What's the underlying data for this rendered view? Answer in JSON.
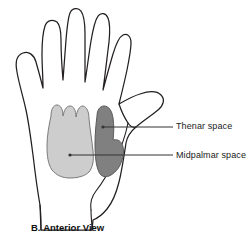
{
  "figure": {
    "caption_letter": "B.",
    "caption_title": "Anterior View",
    "view": "Anterior View"
  },
  "colors": {
    "outline": "#231f20",
    "midpalmar_fill": "#cdcdcd",
    "midpalmar_stroke": "#7a7a7a",
    "thenar_fill": "#808080",
    "thenar_stroke": "#5a5a5a",
    "leader_line": "#333333",
    "text": "#1a1a1a",
    "background": "#ffffff"
  },
  "annotations": [
    {
      "id": "thenar",
      "label": "Thenar space",
      "fill": "#808080",
      "leader": {
        "dot_x": 103,
        "dot_y": 127,
        "end_x": 173,
        "end_y": 127
      },
      "text_x": 176,
      "text_y": 121
    },
    {
      "id": "midpalmar",
      "label": "Midpalmar space",
      "fill": "#cdcdcd",
      "leader": {
        "dot_x": 70,
        "dot_y": 155,
        "end_x": 173,
        "end_y": 155
      },
      "text_x": 176,
      "text_y": 150
    }
  ],
  "shapes": {
    "hand_outline_name": "hand-outline-anterior",
    "midpalmar_space_name": "midpalmar-space-region",
    "thenar_space_name": "thenar-space-region"
  }
}
